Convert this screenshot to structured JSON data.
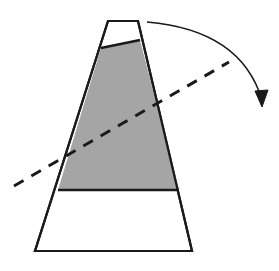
{
  "figure": {
    "width": 279,
    "height": 271,
    "background_color": "#ffffff",
    "stroke_color": "#1a1a1a",
    "fill_color": "#a5a5a5"
  },
  "chart_data": {
    "type": "diagram",
    "xlabel": "",
    "ylabel": "",
    "xlim": [
      0,
      279
    ],
    "ylim": [
      0,
      271
    ],
    "grid": false,
    "legend": "none",
    "shapes": [
      {
        "name": "container-outline",
        "kind": "polygon",
        "points": [
          [
            108,
            21
          ],
          [
            138,
            21
          ],
          [
            192,
            251
          ],
          [
            35,
            251
          ]
        ],
        "fill": "#ffffff",
        "stroke": "#1a1a1a",
        "stroke_width": 2.2
      },
      {
        "name": "liquid-region",
        "kind": "polygon",
        "points": [
          [
            101,
            48
          ],
          [
            140,
            40
          ],
          [
            179,
            190
          ],
          [
            58,
            190
          ]
        ],
        "fill": "#a5a5a5",
        "stroke": "#1a1a1a",
        "stroke_width": 2.2
      },
      {
        "name": "liquid-surface-line",
        "kind": "line",
        "points": [
          [
            101,
            48
          ],
          [
            140,
            40
          ]
        ],
        "stroke": "#1a1a1a",
        "stroke_width": 2.4
      },
      {
        "name": "liquid-base-line",
        "kind": "line",
        "points": [
          [
            58,
            190
          ],
          [
            179,
            190
          ]
        ],
        "stroke": "#1a1a1a",
        "stroke_width": 2.4
      },
      {
        "name": "tilt-axis-dashed-line",
        "kind": "dashed-line",
        "points": [
          [
            14,
            186
          ],
          [
            229,
            62
          ]
        ],
        "stroke": "#1a1a1a",
        "stroke_width": 3.0,
        "dash_pattern": "11 9"
      },
      {
        "name": "rotation-arrow",
        "kind": "curved-arrow",
        "start": [
          147,
          22
        ],
        "control": [
          241,
          30
        ],
        "end": [
          262,
          100
        ],
        "arrow_tip": [
          262,
          107
        ],
        "stroke": "#1a1a1a",
        "stroke_width": 1.6,
        "direction": "clockwise"
      }
    ],
    "annotations": []
  }
}
